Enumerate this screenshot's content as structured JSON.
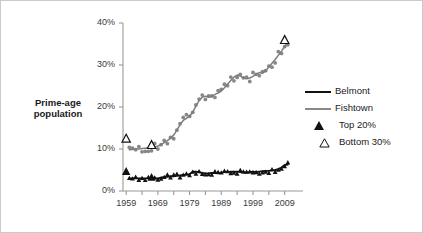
{
  "figure": {
    "ylabel_line1": "Prime-age",
    "ylabel_line2": "population",
    "background": "#ffffff",
    "border_color": "#c9cccd"
  },
  "legend": {
    "position": "right",
    "items": [
      {
        "label": "Belmont",
        "marker": "line",
        "color": "#111111"
      },
      {
        "label": "Fishtown",
        "marker": "line",
        "color": "#888888"
      },
      {
        "label": "Top 20%",
        "marker": "filled-triangle",
        "color": "#111111"
      },
      {
        "label": "Bottom 30%",
        "marker": "open-triangle",
        "color": "#111111"
      }
    ]
  },
  "chart_data": {
    "type": "line",
    "title": "",
    "xlabel": "",
    "ylabel": "Prime-age population",
    "xlim": [
      1958,
      2011
    ],
    "ylim": [
      0,
      40
    ],
    "ytick_labels": [
      "0%",
      "10%",
      "20%",
      "30%",
      "40%"
    ],
    "ytick_values": [
      0,
      10,
      20,
      30,
      40
    ],
    "xtick_labels": [
      "1959",
      "1969",
      "1979",
      "1989",
      "1999",
      "2009"
    ],
    "xtick_values": [
      1959,
      1969,
      1979,
      1989,
      1999,
      2009
    ],
    "minor_xticks": [
      1964,
      1974,
      1984,
      1994,
      2004
    ],
    "grid": false,
    "yaxis_percent": true,
    "series": [
      {
        "name": "Fishtown",
        "type": "line+scatter",
        "color": "#7d7d7d",
        "x": [
          1960,
          1961,
          1962,
          1963,
          1964,
          1965,
          1966,
          1967,
          1968,
          1969,
          1970,
          1971,
          1972,
          1973,
          1974,
          1975,
          1976,
          1977,
          1978,
          1979,
          1980,
          1981,
          1982,
          1983,
          1984,
          1985,
          1986,
          1987,
          1988,
          1989,
          1990,
          1991,
          1992,
          1993,
          1994,
          1995,
          1996,
          1997,
          1998,
          1999,
          2000,
          2001,
          2002,
          2003,
          2004,
          2005,
          2006,
          2007,
          2008,
          2009,
          2010
        ],
        "values": [
          9.8,
          9.9,
          10.0,
          10.0,
          10.1,
          10.2,
          10.3,
          10.4,
          10.5,
          10.7,
          11.0,
          11.5,
          12.0,
          12.6,
          13.3,
          14.5,
          15.8,
          16.8,
          17.3,
          17.8,
          18.8,
          20.2,
          21.5,
          22.3,
          22.6,
          22.3,
          22.6,
          23.0,
          23.3,
          23.8,
          24.6,
          25.5,
          26.3,
          27.1,
          27.6,
          27.4,
          26.9,
          26.7,
          26.9,
          27.3,
          27.8,
          28.2,
          28.0,
          28.6,
          29.5,
          30.4,
          31.3,
          32.3,
          33.3,
          34.4,
          35.5
        ],
        "scatter_note": "gray filled circles, noisy around the smoothed trend line"
      },
      {
        "name": "Belmont",
        "type": "line+scatter",
        "color": "#111111",
        "x": [
          1960,
          1961,
          1962,
          1963,
          1964,
          1965,
          1966,
          1967,
          1968,
          1969,
          1970,
          1971,
          1972,
          1973,
          1974,
          1975,
          1976,
          1977,
          1978,
          1979,
          1980,
          1981,
          1982,
          1983,
          1984,
          1985,
          1986,
          1987,
          1988,
          1989,
          1990,
          1991,
          1992,
          1993,
          1994,
          1995,
          1996,
          1997,
          1998,
          1999,
          2000,
          2001,
          2002,
          2003,
          2004,
          2005,
          2006,
          2007,
          2008,
          2009,
          2010
        ],
        "values": [
          3.0,
          3.0,
          3.0,
          3.0,
          3.0,
          3.0,
          3.0,
          3.0,
          3.0,
          3.0,
          3.2,
          3.3,
          3.4,
          3.5,
          3.5,
          3.6,
          3.7,
          3.8,
          3.9,
          4.0,
          4.6,
          4.6,
          4.5,
          4.3,
          4.2,
          4.2,
          4.3,
          4.3,
          4.2,
          4.3,
          4.5,
          4.5,
          4.6,
          4.6,
          4.6,
          4.5,
          4.4,
          4.4,
          4.5,
          4.6,
          4.5,
          4.6,
          4.7,
          4.8,
          4.8,
          4.9,
          5.0,
          5.2,
          5.6,
          6.2,
          6.3
        ],
        "scatter_note": "black filled triangles, tight noise around the line"
      },
      {
        "name": "Top 20%",
        "type": "marker",
        "marker": "filled-triangle",
        "color": "#111111",
        "x": [
          1959,
          1967
        ],
        "values": [
          4.7,
          3.3
        ]
      },
      {
        "name": "Bottom 30%",
        "type": "marker",
        "marker": "open-triangle",
        "color": "#111111",
        "x": [
          1959,
          1967,
          2009
        ],
        "values": [
          12.5,
          11.0,
          36.0
        ]
      }
    ]
  }
}
